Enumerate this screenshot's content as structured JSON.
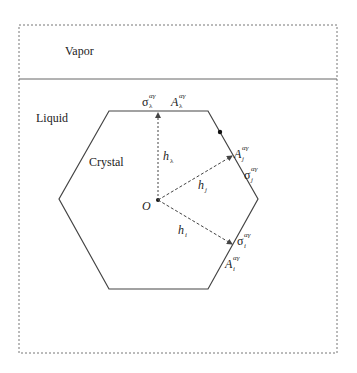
{
  "regions": {
    "vapor": "Vapor",
    "liquid": "Liquid",
    "crystal": "Crystal"
  },
  "origin_label": "O",
  "top_face": {
    "sigma": "σ",
    "sigma_sub": "λ",
    "sigma_sup": "αγ",
    "area": "A",
    "area_sub": "λ",
    "area_sup": "αγ",
    "height": "h",
    "height_sub": "λ"
  },
  "face_j": {
    "sigma": "σ",
    "sigma_sub": "j",
    "sigma_sup": "αγ",
    "area": "A",
    "area_sub": "j",
    "area_sup": "αγ",
    "height": "h",
    "height_sub": "j"
  },
  "face_i": {
    "sigma": "σ",
    "sigma_sub": "i",
    "sigma_sup": "αγ",
    "area": "A",
    "area_sub": "i",
    "area_sup": "αγ",
    "height": "h",
    "height_sub": "i"
  },
  "colors": {
    "line": "#444444",
    "text": "#222222"
  }
}
